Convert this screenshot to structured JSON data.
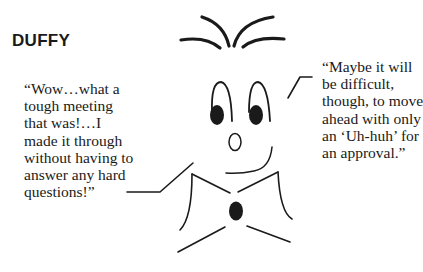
{
  "title": "DUFFY",
  "quotes": {
    "left": {
      "lines": [
        "“Wow…what a",
        "tough meeting",
        "that was!…I",
        "made it through",
        "without having to",
        "answer any hard",
        "questions!”"
      ]
    },
    "right": {
      "lines": [
        "“Maybe it will",
        "be difficult,",
        "though, to move",
        "ahead with only",
        "an ‘Uh-huh’ for",
        "an approval.”"
      ]
    }
  },
  "illustration": {
    "character": "Duffy",
    "stroke_color": "#1a1a1a",
    "background_color": "#ffffff"
  }
}
